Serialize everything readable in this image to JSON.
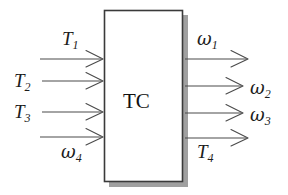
{
  "diagram": {
    "type": "block-diagram",
    "title": "",
    "block": {
      "label": "TC",
      "x": 104,
      "y": 10,
      "width": 79,
      "height": 172,
      "shadow": true,
      "border_color": "#3a3a3a",
      "fill_color": "#ffffff"
    },
    "inputs": [
      {
        "name": "T1",
        "base": "T",
        "subscript": "1",
        "label_x": 62,
        "label_y": 29,
        "arrow_y": 59,
        "arrow_x1": 40,
        "arrow_x2": 103
      },
      {
        "name": "T2",
        "base": "T",
        "subscript": "2",
        "label_x": 14,
        "label_y": 71,
        "arrow_y": 81,
        "arrow_x1": 42,
        "arrow_x2": 103
      },
      {
        "name": "T3",
        "base": "T",
        "subscript": "3",
        "label_x": 14,
        "label_y": 102,
        "arrow_y": 112,
        "arrow_x1": 42,
        "arrow_x2": 103
      },
      {
        "name": "omega4",
        "base": "ω",
        "subscript": "4",
        "label_x": 61,
        "label_y": 142,
        "arrow_y": 137,
        "arrow_x1": 40,
        "arrow_x2": 103
      }
    ],
    "outputs": [
      {
        "name": "omega1",
        "base": "ω",
        "subscript": "1",
        "label_x": 197,
        "label_y": 29,
        "arrow_y": 59,
        "arrow_x1": 184,
        "arrow_x2": 248
      },
      {
        "name": "omega2",
        "base": "ω",
        "subscript": "2",
        "label_x": 250,
        "label_y": 78,
        "arrow_y": 86,
        "arrow_x1": 184,
        "arrow_x2": 243
      },
      {
        "name": "omega3",
        "base": "ω",
        "subscript": "3",
        "label_x": 250,
        "label_y": 105,
        "arrow_y": 113,
        "arrow_x1": 184,
        "arrow_x2": 243
      },
      {
        "name": "T4",
        "base": "T",
        "subscript": "4",
        "label_x": 197,
        "label_y": 142,
        "arrow_y": 138,
        "arrow_x1": 184,
        "arrow_x2": 248
      }
    ],
    "colors": {
      "line": "#4a4a4a",
      "text": "#1c1c1c",
      "shadow": "#8a8a8a",
      "background": "#ffffff"
    }
  }
}
